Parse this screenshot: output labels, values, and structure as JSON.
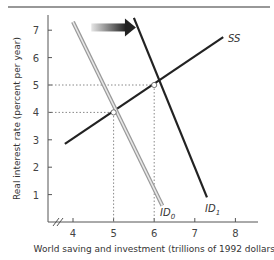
{
  "chart_data": {
    "type": "line",
    "title": "",
    "xlabel": "World saving and investment (trillions of 1992 dollars)",
    "ylabel": "Real interest rate (percent per year)",
    "xlim": [
      3.4,
      8.6
    ],
    "ylim": [
      0,
      7.6
    ],
    "x_ticks": [
      "4",
      "5",
      "6",
      "7",
      "8"
    ],
    "y_ticks": [
      "1",
      "2",
      "3",
      "4",
      "5",
      "6",
      "7"
    ],
    "grid": false,
    "x_axis_break": true,
    "series": [
      {
        "name": "SS",
        "label": "SS",
        "color": "#222222",
        "points": [
          [
            3.8,
            2.85
          ],
          [
            7.7,
            6.75
          ]
        ]
      },
      {
        "name": "ID0",
        "label": "ID",
        "subscript": "0",
        "color": "#aaaaaa",
        "style": "double-line",
        "points": [
          [
            4.0,
            7.3
          ],
          [
            6.2,
            0.6
          ]
        ]
      },
      {
        "name": "ID1",
        "label": "ID",
        "subscript": "1",
        "color": "#222222",
        "points": [
          [
            5.5,
            7.45
          ],
          [
            7.3,
            0.9
          ]
        ]
      }
    ],
    "equilibria": [
      {
        "x": 5,
        "y": 4,
        "label": "initial equilibrium"
      },
      {
        "x": 6,
        "y": 5,
        "label": "new equilibrium"
      }
    ],
    "annotations": [
      {
        "type": "arrow",
        "from": [
          4.45,
          7.1
        ],
        "to": [
          5.55,
          7.1
        ],
        "meaning": "investment demand shifts right"
      }
    ]
  }
}
